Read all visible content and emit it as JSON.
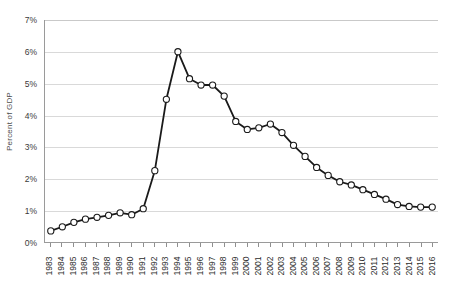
{
  "chart_data": {
    "type": "line",
    "title": "",
    "xlabel": "",
    "ylabel": "Percent of GDP",
    "ylim": [
      0,
      7
    ],
    "ytick_labels": [
      "0%",
      "1%",
      "2%",
      "3%",
      "4%",
      "5%",
      "6%",
      "7%"
    ],
    "ytick_values": [
      0,
      1,
      2,
      3,
      4,
      5,
      6,
      7
    ],
    "grid": true,
    "legend": "none",
    "marker": "open-circle",
    "line_color": "#1a1a1a",
    "marker_fill": "#ffffff",
    "grid_color": "#d9d9d9",
    "categories": [
      "1983",
      "1984",
      "1985",
      "1986",
      "1987",
      "1988",
      "1989",
      "1990",
      "1991",
      "1992",
      "1993",
      "1994",
      "1995",
      "1996",
      "1997",
      "1998",
      "1999",
      "2000",
      "2001",
      "2002",
      "2003",
      "2004",
      "2005",
      "2006",
      "2007",
      "2008",
      "2009",
      "2010",
      "2011",
      "2012",
      "2013",
      "2014",
      "2015",
      "2016"
    ],
    "values": [
      0.35,
      0.48,
      0.62,
      0.72,
      0.78,
      0.84,
      0.92,
      0.86,
      1.05,
      2.25,
      4.5,
      6.0,
      5.15,
      4.95,
      4.95,
      4.6,
      3.8,
      3.55,
      3.6,
      3.72,
      3.45,
      3.05,
      2.7,
      2.35,
      2.1,
      1.9,
      1.8,
      1.65,
      1.5,
      1.35,
      1.18,
      1.12,
      1.1,
      1.1
    ]
  }
}
